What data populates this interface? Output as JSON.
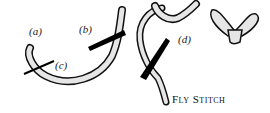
{
  "labels": {
    "a": "(a)",
    "b": "(b)",
    "c": "(c)",
    "d": "(d)"
  },
  "caption": "Fly Stitch",
  "colors": {
    "thread_fill": "#e6e6e6",
    "outline": "#111111",
    "needle": "#000000"
  }
}
